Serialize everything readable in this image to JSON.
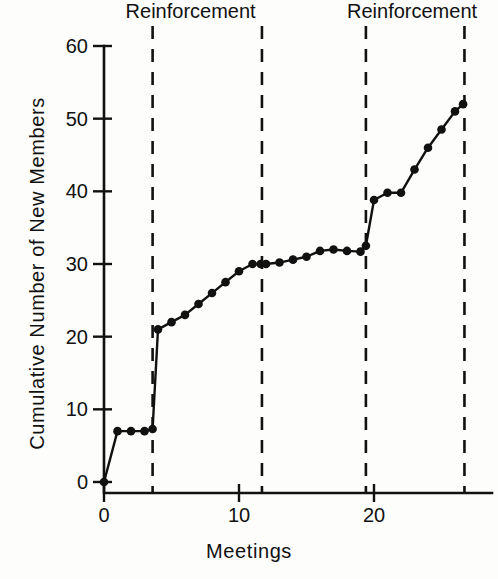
{
  "chart_data": {
    "type": "line",
    "title": "",
    "xlabel": "Meetings",
    "ylabel": "Cumulative Number of New Members",
    "xlim": [
      0,
      27.5
    ],
    "ylim": [
      0,
      62
    ],
    "xticks": [
      0,
      10,
      20
    ],
    "xtick_labels": [
      "0",
      "10",
      "20"
    ],
    "yticks": [
      0,
      10,
      20,
      30,
      40,
      50,
      60
    ],
    "ytick_labels": [
      "0",
      "10",
      "20",
      "30",
      "40",
      "50",
      "60"
    ],
    "grid": false,
    "legend": null,
    "marker": "filled-circle",
    "series": [
      {
        "name": "Cumulative new members",
        "x": [
          0,
          1,
          2,
          3,
          3.6,
          4,
          5,
          6,
          7,
          8,
          9,
          10,
          11,
          11.6,
          12,
          13,
          14,
          15,
          16,
          17,
          18,
          19,
          19.4,
          20,
          21,
          22,
          23,
          24,
          25,
          26,
          26.6
        ],
        "values": [
          0,
          7,
          7,
          7,
          7.3,
          21,
          22,
          23,
          24.5,
          26,
          27.5,
          29,
          30,
          30,
          30,
          30.2,
          30.6,
          31,
          31.8,
          32,
          31.8,
          31.7,
          32.5,
          38.8,
          39.8,
          39.8,
          43,
          46,
          48.5,
          51,
          52
        ]
      }
    ],
    "annotations": [
      {
        "name": "reinforcement-label-1",
        "text": "Reinforcement",
        "x": 1.6,
        "type": "phase-label"
      },
      {
        "name": "reinforcement-label-2",
        "text": "Reinforcement",
        "x": 18.0,
        "type": "phase-label"
      }
    ],
    "phase_lines": [
      {
        "name": "phase-line-1",
        "x": 3.6
      },
      {
        "name": "phase-line-2",
        "x": 11.7
      },
      {
        "name": "phase-line-3",
        "x": 19.4
      },
      {
        "name": "phase-line-4",
        "x": 26.7
      }
    ]
  }
}
